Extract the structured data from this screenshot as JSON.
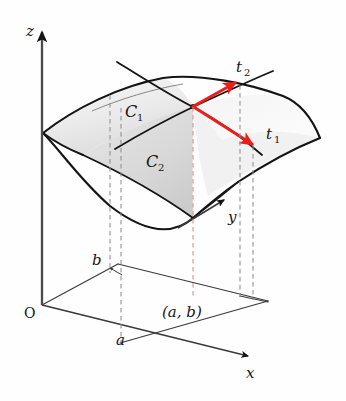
{
  "figure": {
    "type": "3d-surface-tangent-plane-diagram",
    "background_color": "#fefefe",
    "axes": {
      "z": {
        "label": "z",
        "label_x": 26,
        "label_y": 36
      },
      "y": {
        "label": "y",
        "label_x": 228,
        "label_y": 222
      },
      "x": {
        "label": "x",
        "label_x": 246,
        "label_y": 378
      },
      "origin": {
        "label": "O",
        "label_x": 24,
        "label_y": 318
      }
    },
    "point_labels": {
      "a": {
        "text": "a",
        "x": 116,
        "y": 345
      },
      "b": {
        "text": "b",
        "x": 92,
        "y": 265
      },
      "ab": {
        "text": "(a, b)",
        "x": 162,
        "y": 317
      }
    },
    "curves": [
      {
        "name": "C",
        "sub": "1",
        "x": 125,
        "y": 112,
        "sub_x": 139,
        "sub_y": 116
      },
      {
        "name": "C",
        "sub": "2",
        "x": 147,
        "y": 162,
        "sub_x": 161,
        "sub_y": 166
      }
    ],
    "tangents": [
      {
        "name": "t",
        "sub": "2",
        "x": 238,
        "y": 68,
        "sub_x": 247,
        "sub_y": 72,
        "color": "#e8201a"
      },
      {
        "name": "t",
        "sub": "1",
        "x": 268,
        "y": 135,
        "sub_x": 277,
        "sub_y": 139,
        "color": "#e8201a"
      }
    ],
    "colors": {
      "stroke": "#141414",
      "axis": "#4a4a4a",
      "dashed_gray": "#8e8e8e",
      "dashed_pink": "#d98a8a",
      "arrow_red": "#e8201a",
      "surface_fill_light": "#f3f3f3",
      "surface_fill_dark": "#cfcfcf",
      "thin_line": "#3a3a3a"
    }
  }
}
